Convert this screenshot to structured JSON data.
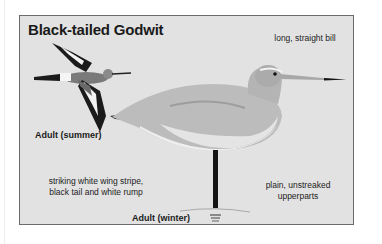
{
  "plate": {
    "title": "Black-tailed Godwit",
    "labels": {
      "summer": "Adult (summer)",
      "winter": "Adult (winter)"
    },
    "notes": {
      "bill": "long, straight bill",
      "wing_line1": "striking white wing stripe,",
      "wing_line2": "black tail and white rump",
      "upper_line1": "plain, unstreaked",
      "upper_line2": "upperparts"
    },
    "illustrations": [
      "flying-bird-summer",
      "standing-bird-winter"
    ],
    "colors": {
      "background": "#e2e2e2",
      "border": "#6a6a6a",
      "text": "#1a1a1a"
    }
  }
}
